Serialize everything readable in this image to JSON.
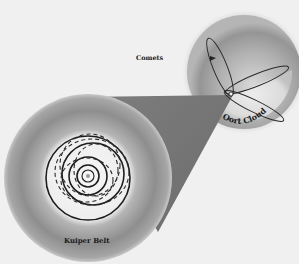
{
  "figure": {
    "type": "solar-system-diagram",
    "labels": {
      "comets": "Comets",
      "oort_cloud": "Oort Cloud",
      "kuiper_belt": "Kuiper Belt"
    },
    "colors": {
      "background": "#f0f0f0",
      "cone": "#7a7a7a",
      "sphere_outer": "#8c8c8c",
      "sphere_inner": "#f4f4f4",
      "orbit_line": "#1e1e1e"
    },
    "kuiper_belt": {
      "center": [
        88,
        178
      ],
      "outer_radius": 83,
      "inner_radius": 45,
      "solid_orbits": 5,
      "dashed_orbits": 4
    },
    "oort_cloud": {
      "center": [
        244,
        72
      ],
      "radius": 57,
      "comet_orbits": 3
    }
  }
}
